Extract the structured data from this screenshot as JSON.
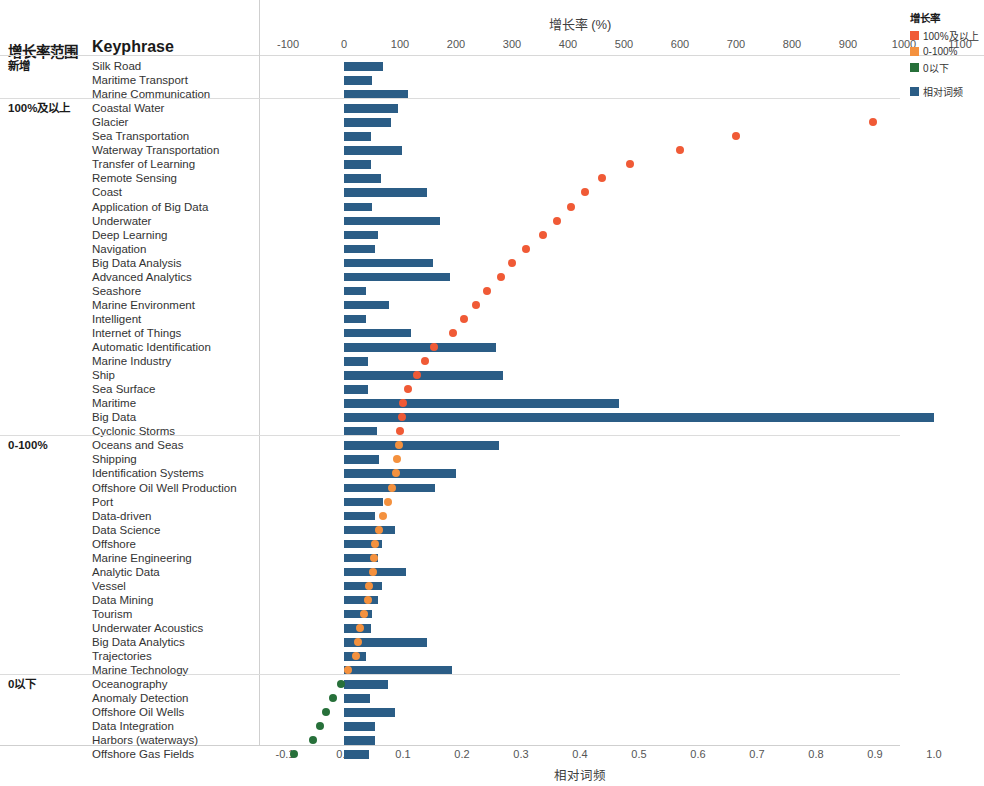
{
  "chart_data": {
    "type": "bar",
    "title": "增长率 (%)",
    "xlabel": "相对词频",
    "x2label": "增长率 (%)",
    "ylabel": "Keyphrase",
    "grid": false,
    "legend_position": "top-right",
    "top_axis": {
      "label": "增长率 (%)",
      "ticks": [
        "-100",
        "0",
        "100",
        "200",
        "300",
        "400",
        "500",
        "600",
        "700",
        "800",
        "900",
        "1000",
        "1100",
        "1200"
      ],
      "min": -100,
      "max": 1200
    },
    "bottom_axis": {
      "label": "相对词频",
      "ticks": [
        "-0.1",
        "0.0",
        "0.1",
        "0.2",
        "0.3",
        "0.4",
        "0.5",
        "0.6",
        "0.7",
        "0.8",
        "0.9",
        "1.0"
      ],
      "min": -0.1,
      "max": 1.0
    },
    "columns": [
      "增长率范围",
      "Keyphrase",
      "相对词频",
      "增长率"
    ],
    "groups": [
      {
        "label": "新增",
        "rows": [
          {
            "keyphrase": "Silk Road",
            "freq": 0.066,
            "growth": null
          },
          {
            "keyphrase": "Maritime Transport",
            "freq": 0.047,
            "growth": null
          },
          {
            "keyphrase": "Marine Communication",
            "freq": 0.108,
            "growth": null
          }
        ]
      },
      {
        "label": "100%及以上",
        "rows": [
          {
            "keyphrase": "Coastal Water",
            "freq": 0.092,
            "growth": 1155
          },
          {
            "keyphrase": "Glacier",
            "freq": 0.079,
            "growth": 945
          },
          {
            "keyphrase": "Sea Transportation",
            "freq": 0.046,
            "growth": 700
          },
          {
            "keyphrase": "Waterway Transportation",
            "freq": 0.098,
            "growth": 600
          },
          {
            "keyphrase": "Transfer of Learning",
            "freq": 0.046,
            "growth": 510
          },
          {
            "keyphrase": "Remote Sensing",
            "freq": 0.063,
            "growth": 460
          },
          {
            "keyphrase": "Coast",
            "freq": 0.14,
            "growth": 430
          },
          {
            "keyphrase": "Application of Big Data",
            "freq": 0.048,
            "growth": 405
          },
          {
            "keyphrase": "Underwater",
            "freq": 0.162,
            "growth": 380
          },
          {
            "keyphrase": "Deep Learning",
            "freq": 0.058,
            "growth": 355
          },
          {
            "keyphrase": "Navigation",
            "freq": 0.053,
            "growth": 325
          },
          {
            "keyphrase": "Big Data Analysis",
            "freq": 0.15,
            "growth": 300
          },
          {
            "keyphrase": "Advanced Analytics",
            "freq": 0.18,
            "growth": 280
          },
          {
            "keyphrase": "Seashore",
            "freq": 0.037,
            "growth": 255
          },
          {
            "keyphrase": "Marine Environment",
            "freq": 0.077,
            "growth": 235
          },
          {
            "keyphrase": "Intelligent",
            "freq": 0.037,
            "growth": 215
          },
          {
            "keyphrase": "Internet of Things",
            "freq": 0.113,
            "growth": 195
          },
          {
            "keyphrase": "Automatic Identification",
            "freq": 0.258,
            "growth": 160
          },
          {
            "keyphrase": "Marine Industry",
            "freq": 0.04,
            "growth": 145
          },
          {
            "keyphrase": "Ship",
            "freq": 0.27,
            "growth": 130
          },
          {
            "keyphrase": "Sea Surface",
            "freq": 0.041,
            "growth": 115
          },
          {
            "keyphrase": "Maritime",
            "freq": 0.466,
            "growth": 105
          },
          {
            "keyphrase": "Big Data",
            "freq": 1.0,
            "growth": 103
          },
          {
            "keyphrase": "Cyclonic Storms",
            "freq": 0.056,
            "growth": 100
          }
        ]
      },
      {
        "label": "0-100%",
        "rows": [
          {
            "keyphrase": "Oceans and Seas",
            "freq": 0.262,
            "growth": 98
          },
          {
            "keyphrase": "Shipping",
            "freq": 0.06,
            "growth": 95
          },
          {
            "keyphrase": "Identification Systems",
            "freq": 0.19,
            "growth": 93
          },
          {
            "keyphrase": "Offshore Oil Well Production",
            "freq": 0.155,
            "growth": 85
          },
          {
            "keyphrase": "Port",
            "freq": 0.066,
            "growth": 78
          },
          {
            "keyphrase": "Data-driven",
            "freq": 0.052,
            "growth": 70
          },
          {
            "keyphrase": "Data Science",
            "freq": 0.086,
            "growth": 63
          },
          {
            "keyphrase": "Offshore",
            "freq": 0.064,
            "growth": 56
          },
          {
            "keyphrase": "Marine Engineering",
            "freq": 0.057,
            "growth": 53
          },
          {
            "keyphrase": "Analytic Data",
            "freq": 0.105,
            "growth": 52
          },
          {
            "keyphrase": "Vessel",
            "freq": 0.065,
            "growth": 45
          },
          {
            "keyphrase": "Data Mining",
            "freq": 0.057,
            "growth": 43
          },
          {
            "keyphrase": "Tourism",
            "freq": 0.048,
            "growth": 35
          },
          {
            "keyphrase": "Underwater Acoustics",
            "freq": 0.046,
            "growth": 28
          },
          {
            "keyphrase": "Big Data Analytics",
            "freq": 0.14,
            "growth": 25
          },
          {
            "keyphrase": "Trajectories",
            "freq": 0.038,
            "growth": 22
          },
          {
            "keyphrase": "Marine Technology",
            "freq": 0.183,
            "growth": 8
          }
        ]
      },
      {
        "label": "0以下",
        "rows": [
          {
            "keyphrase": "Oceanography",
            "freq": 0.074,
            "growth": -5
          },
          {
            "keyphrase": "Anomaly Detection",
            "freq": 0.044,
            "growth": -20
          },
          {
            "keyphrase": "Offshore Oil Wells",
            "freq": 0.086,
            "growth": -32
          },
          {
            "keyphrase": "Data Integration",
            "freq": 0.052,
            "growth": -42
          },
          {
            "keyphrase": "Harbors (waterways)",
            "freq": 0.053,
            "growth": -55
          },
          {
            "keyphrase": "Offshore Gas Fields",
            "freq": 0.043,
            "growth": -90
          }
        ]
      }
    ]
  },
  "legend": {
    "title": "增长率",
    "items": [
      {
        "label": "100%及以上",
        "color": "#f05a36",
        "icon": "square-swatch"
      },
      {
        "label": "0-100%",
        "color": "#f4913e",
        "icon": "square-swatch"
      },
      {
        "label": "0以下",
        "color": "#27703a",
        "icon": "square-swatch"
      },
      {
        "label": "相对词频",
        "color": "#2b5d86",
        "icon": "square-swatch"
      }
    ]
  },
  "headers": {
    "range": "增长率范围",
    "keyphrase": "Keyphrase"
  }
}
